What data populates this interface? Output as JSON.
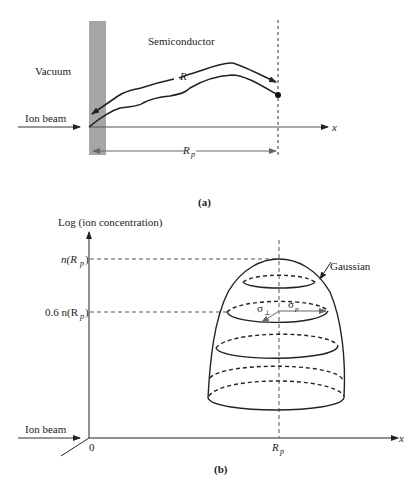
{
  "panel_a": {
    "caption": "(a)",
    "region_left": "Vacuum",
    "region_right": "Semiconductor",
    "beam_label": "Ion beam",
    "path_label": "R",
    "projected_range_label": "R",
    "projected_range_sub": "p",
    "axis_label": "x",
    "surface_color": "#a6a6a6"
  },
  "panel_b": {
    "caption": "(b)",
    "y_axis_label": "Log (ion concentration)",
    "x_axis_label": "x",
    "origin_label": "0",
    "beam_label": "Ion beam",
    "peak_label_n": "n(R",
    "peak_label_sub": "p",
    "peak_label_close": ")",
    "level_label_prefix": "0.6 n(R",
    "level_label_sub": "p",
    "level_label_close": ")",
    "xtick_label": "R",
    "xtick_sub": "p",
    "curve_label": "Gaussian",
    "sigma_perp": "σ",
    "sigma_perp_sub": "⊥",
    "sigma_p": "σ",
    "sigma_p_sub": "p"
  }
}
